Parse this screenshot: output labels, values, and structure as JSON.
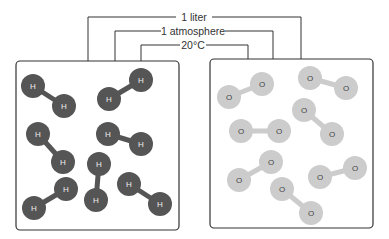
{
  "labels": {
    "volume": "1 liter",
    "pressure": "1 atmosphere",
    "temperature": "20°C"
  },
  "left_container": {
    "gas": "hydrogen",
    "atom_label": "H",
    "atom_color": "#555555",
    "molecules": [
      [
        [
          33,
          86
        ],
        [
          64,
          106
        ]
      ],
      [
        [
          109,
          99
        ],
        [
          141,
          80
        ]
      ],
      [
        [
          108,
          134
        ],
        [
          141,
          144
        ]
      ],
      [
        [
          38,
          134
        ],
        [
          63,
          162
        ]
      ],
      [
        [
          99,
          164
        ],
        [
          96,
          200
        ]
      ],
      [
        [
          66,
          189
        ],
        [
          34,
          208
        ]
      ],
      [
        [
          129,
          184
        ],
        [
          160,
          204
        ]
      ]
    ]
  },
  "right_container": {
    "gas": "oxygen",
    "atom_label": "O",
    "atom_color": "#cccccc",
    "molecules": [
      [
        [
          229,
          97
        ],
        [
          262,
          84
        ]
      ],
      [
        [
          310,
          78
        ],
        [
          346,
          88
        ]
      ],
      [
        [
          304,
          110
        ],
        [
          332,
          134
        ]
      ],
      [
        [
          241,
          131
        ],
        [
          279,
          131
        ]
      ],
      [
        [
          271,
          162
        ],
        [
          239,
          180
        ]
      ],
      [
        [
          320,
          177
        ],
        [
          355,
          168
        ]
      ],
      [
        [
          282,
          189
        ],
        [
          311,
          213
        ]
      ]
    ]
  }
}
